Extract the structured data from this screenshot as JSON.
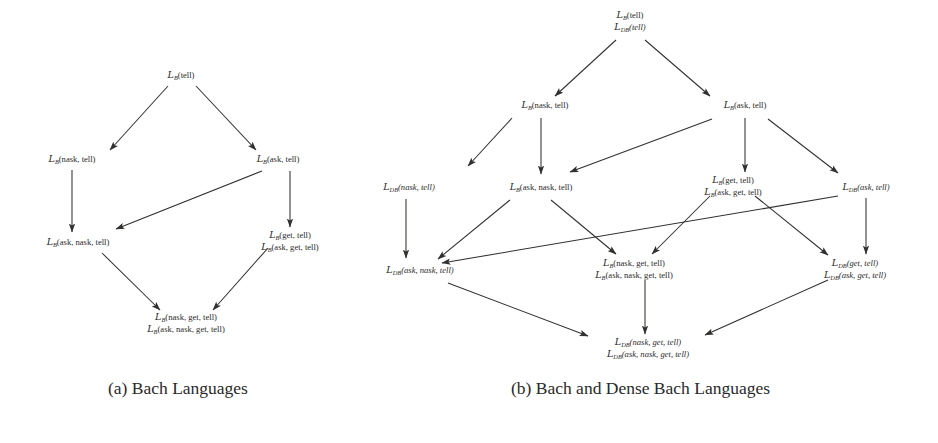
{
  "figure": {
    "background_color": "#ffffff",
    "line_color": "#30302f",
    "text_color": "#2b2b2b"
  },
  "panels": [
    {
      "id": "panel-a",
      "caption": "(a) Bach Languages",
      "caption_x": 108,
      "caption_y": 378,
      "nodes": [
        {
          "id": "a-tell",
          "x": 181,
          "y": 78,
          "lines": [
            {
              "cal": "L",
              "sub": "B",
              "body": "(tell)",
              "italic": false
            }
          ]
        },
        {
          "id": "a-nask-tell",
          "x": 72,
          "y": 162,
          "lines": [
            {
              "cal": "L",
              "sub": "B",
              "body": "(nask, tell)",
              "italic": false
            }
          ]
        },
        {
          "id": "a-ask-tell",
          "x": 278,
          "y": 162,
          "lines": [
            {
              "cal": "L",
              "sub": "B",
              "body": "(ask, tell)",
              "italic": false
            }
          ]
        },
        {
          "id": "a-ask-nask-tell",
          "x": 78,
          "y": 245,
          "lines": [
            {
              "cal": "L",
              "sub": "B",
              "body": "(ask, nask, tell)",
              "italic": false
            }
          ]
        },
        {
          "id": "a-get-tell",
          "x": 290,
          "y": 238,
          "lines": [
            {
              "cal": "L",
              "sub": "B",
              "body": "(get, tell)",
              "italic": false
            },
            {
              "cal": "L",
              "sub": "B",
              "body": "(ask, get, tell)",
              "italic": false
            }
          ]
        },
        {
          "id": "a-bottom",
          "x": 186,
          "y": 320,
          "lines": [
            {
              "cal": "L",
              "sub": "B",
              "body": "(nask, get, tell)",
              "italic": false
            },
            {
              "cal": "L",
              "sub": "B",
              "body": "(ask, nask, get, tell)",
              "italic": false
            }
          ]
        }
      ],
      "edges": [
        {
          "from": "a-tell",
          "to": "a-nask-tell",
          "x1": 168,
          "y1": 86,
          "x2": 110,
          "y2": 150
        },
        {
          "from": "a-tell",
          "to": "a-ask-tell",
          "x1": 196,
          "y1": 86,
          "x2": 256,
          "y2": 150
        },
        {
          "from": "a-nask-tell",
          "to": "a-ask-nask-tell",
          "x1": 72,
          "y1": 170,
          "x2": 72,
          "y2": 232
        },
        {
          "from": "a-ask-tell",
          "to": "a-ask-nask-tell",
          "x1": 262,
          "y1": 171,
          "x2": 116,
          "y2": 229
        },
        {
          "from": "a-ask-tell",
          "to": "a-get-tell",
          "x1": 290,
          "y1": 171,
          "x2": 290,
          "y2": 227
        },
        {
          "from": "a-ask-nask-tell",
          "to": "a-bottom",
          "x1": 102,
          "y1": 253,
          "x2": 160,
          "y2": 310
        },
        {
          "from": "a-get-tell",
          "to": "a-bottom",
          "x1": 268,
          "y1": 248,
          "x2": 213,
          "y2": 310
        }
      ]
    },
    {
      "id": "panel-b",
      "caption": "(b) Bach and Dense Bach Languages",
      "caption_x": 511,
      "caption_y": 378,
      "nodes": [
        {
          "id": "b-tell",
          "x": 630,
          "y": 18,
          "lines": [
            {
              "cal": "L",
              "sub": "B",
              "body": "(tell)",
              "italic": false
            },
            {
              "cal": "L",
              "sub": "DB",
              "body": "(tell)",
              "italic": true
            }
          ]
        },
        {
          "id": "b-nask-tell",
          "x": 545,
          "y": 108,
          "lines": [
            {
              "cal": "L",
              "sub": "B",
              "body": "(nask, tell)",
              "italic": false
            }
          ]
        },
        {
          "id": "b-ask-tell",
          "x": 745,
          "y": 108,
          "lines": [
            {
              "cal": "L",
              "sub": "B",
              "body": "(ask, tell)",
              "italic": false
            }
          ]
        },
        {
          "id": "b-db-nask-tell",
          "x": 409,
          "y": 190,
          "lines": [
            {
              "cal": "L",
              "sub": "DB",
              "body": "(nask, tell)",
              "italic": true
            }
          ]
        },
        {
          "id": "b-ask-nask-tell",
          "x": 541,
          "y": 190,
          "lines": [
            {
              "cal": "L",
              "sub": "B",
              "body": "(ask, nask, tell)",
              "italic": false
            }
          ]
        },
        {
          "id": "b-get-tell",
          "x": 733,
          "y": 183,
          "lines": [
            {
              "cal": "L",
              "sub": "B",
              "body": "(get, tell)",
              "italic": false
            },
            {
              "cal": "L",
              "sub": "B",
              "body": "(ask, get, tell)",
              "italic": false
            }
          ]
        },
        {
          "id": "b-db-ask-tell",
          "x": 866,
          "y": 190,
          "lines": [
            {
              "cal": "L",
              "sub": "DB",
              "body": "(ask, tell)",
              "italic": true
            }
          ]
        },
        {
          "id": "b-db-ask-nask",
          "x": 420,
          "y": 273,
          "lines": [
            {
              "cal": "L",
              "sub": "DB",
              "body": "(ask, nask, tell)",
              "italic": true
            }
          ]
        },
        {
          "id": "b-nask-get-tell",
          "x": 634,
          "y": 266,
          "lines": [
            {
              "cal": "L",
              "sub": "B",
              "body": "(nask, get, tell)",
              "italic": false
            },
            {
              "cal": "L",
              "sub": "B",
              "body": "(ask, nask, get, tell)",
              "italic": false
            }
          ]
        },
        {
          "id": "b-db-get-tell",
          "x": 855,
          "y": 266,
          "lines": [
            {
              "cal": "L",
              "sub": "DB",
              "body": "(get, tell)",
              "italic": true
            },
            {
              "cal": "L",
              "sub": "DB",
              "body": "(ask, get, tell)",
              "italic": true
            }
          ]
        },
        {
          "id": "b-bottom",
          "x": 648,
          "y": 345,
          "lines": [
            {
              "cal": "L",
              "sub": "DB",
              "body": "(nask, get, tell)",
              "italic": true
            },
            {
              "cal": "L",
              "sub": "DB",
              "body": "(ask, nask, get, tell)",
              "italic": true
            }
          ]
        }
      ],
      "edges": [
        {
          "from": "b-tell",
          "to": "b-nask-tell",
          "x1": 616,
          "y1": 40,
          "x2": 555,
          "y2": 96
        },
        {
          "from": "b-tell",
          "to": "b-ask-tell",
          "x1": 645,
          "y1": 40,
          "x2": 710,
          "y2": 96
        },
        {
          "from": "b-nask-tell",
          "to": "b-db-nask-tell",
          "x1": 512,
          "y1": 118,
          "x2": 468,
          "y2": 166
        },
        {
          "from": "b-nask-tell",
          "to": "b-ask-nask-tell",
          "x1": 541,
          "y1": 118,
          "x2": 541,
          "y2": 174
        },
        {
          "from": "b-ask-tell",
          "to": "b-ask-nask-tell",
          "x1": 712,
          "y1": 119,
          "x2": 570,
          "y2": 172
        },
        {
          "from": "b-ask-tell",
          "to": "b-get-tell",
          "x1": 745,
          "y1": 118,
          "x2": 745,
          "y2": 172
        },
        {
          "from": "b-ask-tell",
          "to": "b-db-ask-tell",
          "x1": 768,
          "y1": 119,
          "x2": 838,
          "y2": 173
        },
        {
          "from": "b-db-nask-tell",
          "to": "b-db-ask-nask",
          "x1": 406,
          "y1": 199,
          "x2": 406,
          "y2": 258
        },
        {
          "from": "b-ask-nask-tell",
          "to": "b-db-ask-nask",
          "x1": 510,
          "y1": 200,
          "x2": 438,
          "y2": 259
        },
        {
          "from": "b-ask-nask-tell",
          "to": "b-nask-get-tell",
          "x1": 551,
          "y1": 200,
          "x2": 616,
          "y2": 254
        },
        {
          "from": "b-get-tell",
          "to": "b-nask-get-tell",
          "x1": 710,
          "y1": 196,
          "x2": 652,
          "y2": 254
        },
        {
          "from": "b-get-tell",
          "to": "b-db-get-tell",
          "x1": 755,
          "y1": 196,
          "x2": 828,
          "y2": 255
        },
        {
          "from": "b-db-ask-tell",
          "to": "b-db-ask-nask",
          "x1": 838,
          "y1": 196,
          "x2": 442,
          "y2": 263
        },
        {
          "from": "b-db-ask-tell",
          "to": "b-db-get-tell",
          "x1": 866,
          "y1": 198,
          "x2": 866,
          "y2": 254
        },
        {
          "from": "b-db-ask-nask",
          "to": "b-bottom",
          "x1": 448,
          "y1": 283,
          "x2": 588,
          "y2": 336
        },
        {
          "from": "b-nask-get-tell",
          "to": "b-bottom",
          "x1": 645,
          "y1": 280,
          "x2": 645,
          "y2": 334
        },
        {
          "from": "b-db-get-tell",
          "to": "b-bottom",
          "x1": 828,
          "y1": 280,
          "x2": 705,
          "y2": 335
        }
      ]
    }
  ]
}
